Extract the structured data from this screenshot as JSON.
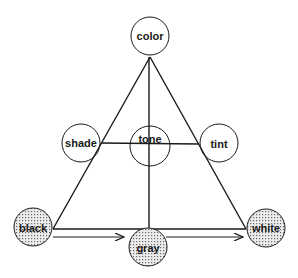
{
  "diagram": {
    "nodes": {
      "color": {
        "label": "color",
        "fill": "plain"
      },
      "shade": {
        "label": "shade",
        "fill": "plain"
      },
      "tone": {
        "label": "tone",
        "fill": "plain"
      },
      "tint": {
        "label": "tint",
        "fill": "plain"
      },
      "black": {
        "label": "black",
        "fill": "dotted"
      },
      "gray": {
        "label": "gray",
        "fill": "dotted"
      },
      "white": {
        "label": "white",
        "fill": "dotted"
      }
    },
    "edges": [
      {
        "from": "color",
        "to": "black",
        "type": "line"
      },
      {
        "from": "color",
        "to": "white",
        "type": "line"
      },
      {
        "from": "color",
        "to": "gray",
        "type": "line"
      },
      {
        "from": "shade",
        "to": "tint",
        "type": "line"
      },
      {
        "from": "black",
        "to": "white",
        "type": "line"
      },
      {
        "from": "black",
        "to": "gray",
        "type": "arrow"
      },
      {
        "from": "gray",
        "to": "white",
        "type": "arrow"
      }
    ],
    "colors": {
      "stroke": "#1a1a1a",
      "background": "#ffffff",
      "dot": "#6a6a6a",
      "dot_bg": "#ececec"
    }
  }
}
